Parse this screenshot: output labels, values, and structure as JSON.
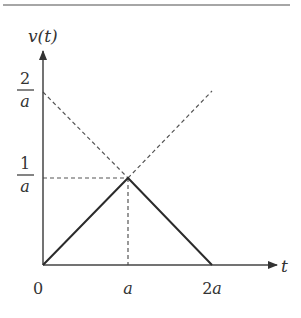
{
  "diagram": {
    "title": "",
    "y_axis_label": "v(t)",
    "x_axis_label": "t",
    "x_ticks": [
      {
        "label_num": "0",
        "label_var": ""
      },
      {
        "label_num": "",
        "label_var": "a"
      },
      {
        "label_num": "2",
        "label_var": "a"
      }
    ],
    "y_ticks": [
      {
        "numerator": "1",
        "denominator": "a"
      },
      {
        "numerator": "2",
        "denominator": "a"
      }
    ],
    "colors": {
      "solid_line": "#2b2b2b",
      "dashed_line": "#555555",
      "axis": "#444444",
      "rule": "#888888"
    },
    "shape": "triangular pulse from 0 to 2a peaking at 1/a at t=a",
    "dashed_guides": [
      "line from (0, 2/a) through peak to (2a, 0)",
      "line from (0, 0) through peak extending upward to (2a, 2/a)",
      "horizontal guide at v = 1/a",
      "vertical guide at t = a"
    ]
  }
}
